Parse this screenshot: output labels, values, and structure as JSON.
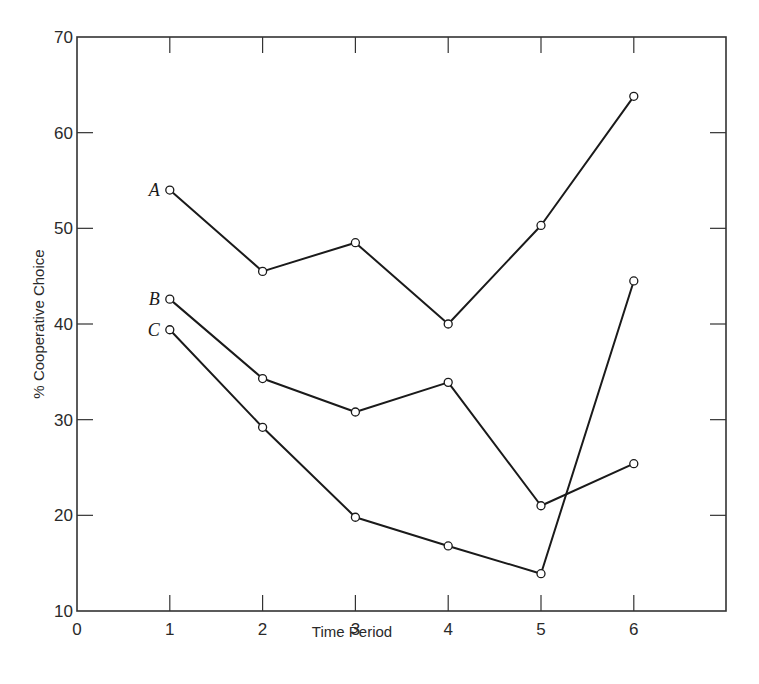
{
  "chart_data": {
    "type": "line",
    "title": "",
    "xlabel": "Time Period",
    "ylabel": "% Cooperative Choice",
    "x": [
      1,
      2,
      3,
      4,
      5,
      6
    ],
    "xlim": [
      0,
      7
    ],
    "ylim": [
      10,
      70
    ],
    "xticks": [
      0,
      1,
      2,
      3,
      4,
      5,
      6
    ],
    "yticks": [
      10,
      20,
      30,
      40,
      50,
      60,
      70
    ],
    "grid": false,
    "legend": "inline labels at left of each series",
    "marker": "open circle",
    "series": [
      {
        "name": "A",
        "values": [
          54,
          45.5,
          48.5,
          40,
          50.3,
          63.8
        ]
      },
      {
        "name": "B",
        "values": [
          42.6,
          34.3,
          30.8,
          33.9,
          21,
          25.4
        ]
      },
      {
        "name": "C",
        "values": [
          39.4,
          29.2,
          19.8,
          16.8,
          13.9,
          44.5
        ]
      }
    ]
  },
  "colors": {
    "line": "#1a1a1a",
    "axis": "#333333",
    "marker_fill": "#ffffff"
  }
}
